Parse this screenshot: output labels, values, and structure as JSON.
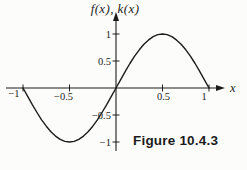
{
  "figure": {
    "caption": "Figure 10.4.3"
  },
  "colors": {
    "ink": "#1c1c1c",
    "background": "#fcfcfb"
  },
  "chart_data": {
    "type": "line",
    "title": "",
    "xlabel": "x",
    "ylabel": "f(x), k(x)",
    "xlim": [
      -1,
      1
    ],
    "ylim": [
      -1,
      1
    ],
    "grid": false,
    "legend": null,
    "caption": "Figure 10.4.3",
    "x_ticks": [
      {
        "v": -1,
        "label": "−1"
      },
      {
        "v": -0.5,
        "label": "−0.5"
      },
      {
        "v": 0.5,
        "label": "0.5"
      },
      {
        "v": 1,
        "label": "1"
      }
    ],
    "y_ticks": [
      {
        "v": 1,
        "label": "1"
      },
      {
        "v": 0.5,
        "label": "0.5"
      },
      {
        "v": -0.5,
        "label": "−0.5"
      },
      {
        "v": -1,
        "label": "−1"
      }
    ],
    "series": [
      {
        "name": "f(x) = sin(pi x)",
        "points": [
          [
            -1,
            0
          ],
          [
            -0.95,
            -0.156
          ],
          [
            -0.9,
            -0.309
          ],
          [
            -0.85,
            -0.454
          ],
          [
            -0.8,
            -0.588
          ],
          [
            -0.75,
            -0.707
          ],
          [
            -0.7,
            -0.809
          ],
          [
            -0.65,
            -0.891
          ],
          [
            -0.6,
            -0.951
          ],
          [
            -0.55,
            -0.988
          ],
          [
            -0.5,
            -1
          ],
          [
            -0.45,
            -0.988
          ],
          [
            -0.4,
            -0.951
          ],
          [
            -0.35,
            -0.891
          ],
          [
            -0.3,
            -0.809
          ],
          [
            -0.25,
            -0.707
          ],
          [
            -0.2,
            -0.588
          ],
          [
            -0.15,
            -0.454
          ],
          [
            -0.1,
            -0.309
          ],
          [
            -0.05,
            -0.156
          ],
          [
            0,
            0
          ],
          [
            0.05,
            0.156
          ],
          [
            0.1,
            0.309
          ],
          [
            0.15,
            0.454
          ],
          [
            0.2,
            0.588
          ],
          [
            0.25,
            0.707
          ],
          [
            0.3,
            0.809
          ],
          [
            0.35,
            0.891
          ],
          [
            0.4,
            0.951
          ],
          [
            0.45,
            0.988
          ],
          [
            0.5,
            1
          ],
          [
            0.55,
            0.988
          ],
          [
            0.6,
            0.951
          ],
          [
            0.65,
            0.891
          ],
          [
            0.7,
            0.809
          ],
          [
            0.75,
            0.707
          ],
          [
            0.8,
            0.588
          ],
          [
            0.85,
            0.454
          ],
          [
            0.9,
            0.309
          ],
          [
            0.95,
            0.156
          ],
          [
            1,
            0
          ]
        ]
      }
    ]
  }
}
